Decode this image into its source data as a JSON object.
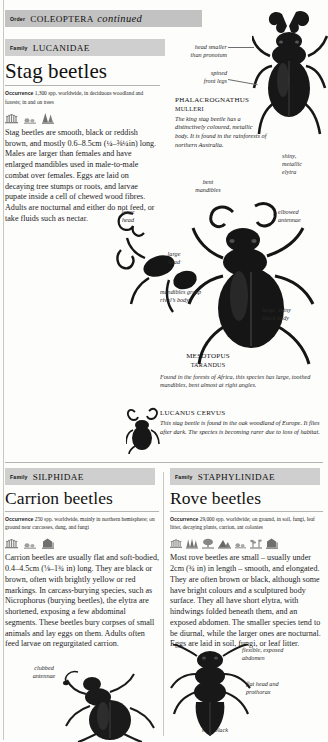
{
  "order_band": {
    "rank": "Order",
    "name": "COLEOPTERA",
    "continued": "continued"
  },
  "sections": [
    {
      "rank": "Family",
      "family": "LUCANIDAE",
      "title": "Stag beetles",
      "occurrence_label": "Occurrence",
      "occurrence": "1,300 spp. worldwide, in deciduous woodland and forests; in and on trees",
      "body": "Stag beetles are smooth, black or reddish brown, and mostly 0.6–8.5cm (¼–⅜¼in) long. Males are larger than females and have enlarged mandibles used in male-to-male combat over females. Eggs are laid on decaying tree stumps or roots, and larvae pupate inside a cell of chewed wood fibres. Adults are nocturnal and either do not feed, or take fluids such as nectar."
    },
    {
      "rank": "Family",
      "family": "SILPHIDAE",
      "title": "Carrion beetles",
      "occurrence_label": "Occurrence",
      "occurrence": "250 spp. worldwide, mainly in northern hemisphere; on ground near carcasses, dung, and fungi",
      "body": "Carrion beetles are usually flat and soft-bodied, 0.4–4.5cm (⅛–1¾ in) long. They are black or brown, often with brightly yellow or red markings. In carcass-burying species, such as Nicrophorus (burying beetles), the elytra are shortened, exposing a few abdominal segments. These beetles bury corpses of small animals and lay eggs on them. Adults often feed larvae on regurgitated carrion."
    },
    {
      "rank": "Family",
      "family": "STAPHYLINIDAE",
      "title": "Rove beetles",
      "occurrence_label": "Occurrence",
      "occurrence": "29,000 spp. worldwide; on ground, in soil, fungi, leaf litter, decaying plants, carrion, ant colonies",
      "body": "Most rove beetles are small – usually under 2cm (¾ in) in length – smooth, and elongated. They are often brown or black, although some have bright colours and a sculptured body surface. They all have short elytra, with hindwings folded beneath them, and an exposed abdomen. The smaller species tend to be diurnal, while the larger ones are nocturnal. Eggs are laid in soil, fungi, or leaf litter."
    }
  ],
  "annotations": {
    "head_smaller": "head smaller\nthan pronotum",
    "spined_legs": "spined\nfront legs",
    "bent_mandibles": "bent\nmandibles",
    "shiny_elytra": "shiny,\nmetallic\nelytra",
    "elbowed_antennae": "elbowed\nantennae",
    "large_head": "large\nhead",
    "mandibles_grasp": "mandibles grasp\nrival’s body",
    "large_shiny_body": "large, shiny\nblack body",
    "clubbed_antennae": "clubbed\nantennae",
    "flexible_abdomen": "flexible, exposed\nabdomen",
    "flat_head": "flat head and\nprothorax",
    "matt_black": "matt black"
  },
  "captions": [
    {
      "id": "phalacrognathus",
      "genus": "PHALACROGNATHUS",
      "species": "MULLERI",
      "text": "The king stag beetle has a distinctively coloured, metallic body. It is found in the rainforests of northern Australia."
    },
    {
      "id": "mesotopus",
      "genus": "MESOTOPUS",
      "species": "TARANDUS",
      "text": "Found in the forests of Africa, this species has large, toothed mandibles, bent almost at right angles."
    },
    {
      "id": "lucanus",
      "genus": "LUCANUS CERVUS",
      "species": "",
      "text": "This stag beetle is found in the oak woodland of Europe. It flies after dark. The species is becoming rarer due to loss of habitat."
    }
  ],
  "habitat_icons": {
    "stag": [
      "grass-icon",
      "trees-icon",
      "forest-icon"
    ],
    "carrion": [
      "grass-icon",
      "shrub-icon",
      "building-icon"
    ],
    "rove": [
      "grass-icon",
      "trees-icon",
      "tree-icon",
      "mountain-icon",
      "shrub-icon",
      "plants-icon",
      "building-icon"
    ]
  },
  "colors": {
    "band": "#c9c9c9",
    "rule": "#b5b5b0",
    "text": "#1a1a1a"
  }
}
